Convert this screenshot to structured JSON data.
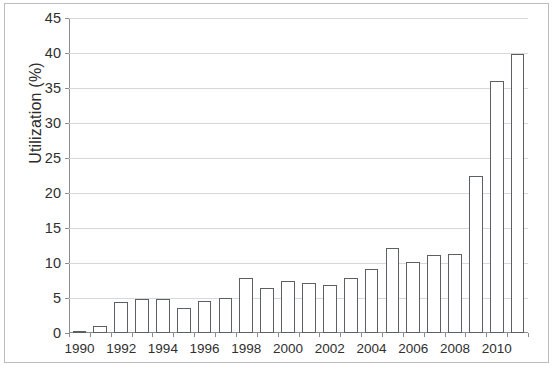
{
  "chart_data": {
    "type": "bar",
    "title": "",
    "subtitle": "",
    "xlabel": "",
    "ylabel": "Utilization (%)",
    "ylim": [
      0,
      45
    ],
    "ytick_step": 5,
    "yticks": [
      0,
      5,
      10,
      15,
      20,
      25,
      30,
      35,
      40,
      45
    ],
    "ytick_labels": [
      "0",
      "5",
      "10",
      "15",
      "20",
      "25",
      "30",
      "35",
      "40",
      "45"
    ],
    "grid": true,
    "grid_axis": "y",
    "legend": false,
    "legend_position": "none",
    "bar_face_color": "#ffffff",
    "bar_edge_color": "#5c5f63",
    "axis_color": "#8a8d90",
    "grid_color": "#d6d8da",
    "text_color": "#2f2f2f",
    "categories": [
      "1990",
      "1991",
      "1992",
      "1993",
      "1994",
      "1995",
      "1996",
      "1997",
      "1998",
      "1999",
      "2000",
      "2001",
      "2002",
      "2003",
      "2004",
      "2005",
      "2006",
      "2007",
      "2008",
      "2009",
      "2010",
      "2011"
    ],
    "xtick_labels": [
      "1990",
      "",
      "1992",
      "",
      "1994",
      "",
      "1996",
      "",
      "1998",
      "",
      "2000",
      "",
      "2002",
      "",
      "2004",
      "",
      "2006",
      "",
      "2008",
      "",
      "2010",
      ""
    ],
    "xtick_labels_shown": [
      "1990",
      "1992",
      "1994",
      "1996",
      "1998",
      "2000",
      "2002",
      "2004",
      "2006",
      "2008",
      "2010"
    ],
    "values": [
      0.2,
      1.0,
      4.4,
      4.8,
      4.8,
      3.6,
      4.6,
      5.0,
      7.9,
      6.4,
      7.5,
      7.1,
      6.9,
      7.9,
      9.2,
      12.1,
      10.1,
      11.1,
      11.3,
      22.4,
      36.0,
      39.8
    ],
    "units": "%"
  }
}
